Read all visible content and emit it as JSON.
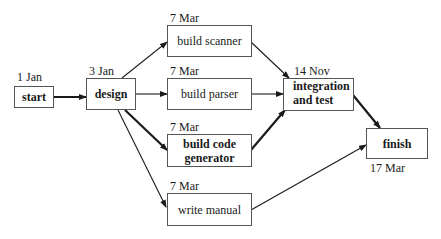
{
  "diagram": {
    "type": "activity-network",
    "nodes": [
      {
        "id": "start",
        "label": "start",
        "date": "1 Jan",
        "bold": true
      },
      {
        "id": "design",
        "label": "design",
        "date": "3 Jan",
        "bold": true
      },
      {
        "id": "build_scanner",
        "label": "build scanner",
        "date": "7 Mar",
        "bold": false
      },
      {
        "id": "build_parser",
        "label": "build parser",
        "date": "7 Mar",
        "bold": false
      },
      {
        "id": "build_code_generator",
        "label": "build code generator",
        "line1": "build code",
        "line2": "generator",
        "date": "7 Mar",
        "bold": true
      },
      {
        "id": "write_manual",
        "label": "write manual",
        "date": "7 Mar",
        "bold": false
      },
      {
        "id": "integration",
        "label": "integration and test",
        "line1": "integration",
        "line2": "and test",
        "date": "14 Nov",
        "bold": true
      },
      {
        "id": "finish",
        "label": "finish",
        "date": "17 Mar",
        "bold": true
      }
    ],
    "edges": [
      {
        "from": "start",
        "to": "design",
        "critical": true
      },
      {
        "from": "design",
        "to": "build_scanner",
        "critical": false
      },
      {
        "from": "design",
        "to": "build_parser",
        "critical": false
      },
      {
        "from": "design",
        "to": "build_code_generator",
        "critical": true
      },
      {
        "from": "design",
        "to": "write_manual",
        "critical": false
      },
      {
        "from": "build_scanner",
        "to": "integration",
        "critical": false
      },
      {
        "from": "build_parser",
        "to": "integration",
        "critical": false
      },
      {
        "from": "build_code_generator",
        "to": "integration",
        "critical": true
      },
      {
        "from": "integration",
        "to": "finish",
        "critical": true
      },
      {
        "from": "write_manual",
        "to": "finish",
        "critical": false
      }
    ]
  }
}
